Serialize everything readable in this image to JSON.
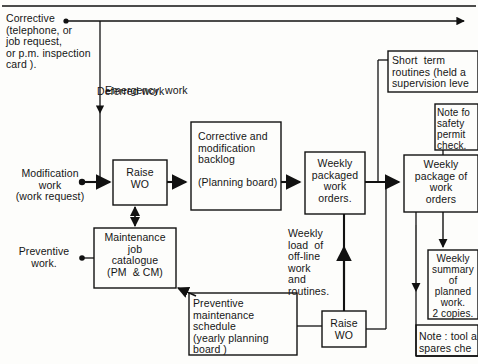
{
  "diagram": {
    "type": "flowchart",
    "stroke_color": "#111111",
    "background_color": "#fdfdfb"
  },
  "inputs": [
    {
      "id": "corrective",
      "label": "Corrective\n(telephone, or\njob request,\nor p.m. inspection\ncard )."
    },
    {
      "id": "modification",
      "label": "Modification\nwork\n(work request)"
    },
    {
      "id": "preventive",
      "label": "Preventive\nwork."
    }
  ],
  "flow_labels": [
    {
      "id": "emergency-work",
      "text": "Emergency  work"
    },
    {
      "id": "deferred-work",
      "text": "Deferred work"
    },
    {
      "id": "weekly-load",
      "text": "Weekly\nload  of\noff-line\nwork\nand\nroutines."
    }
  ],
  "boxes": [
    {
      "id": "raise-wo-top",
      "text": "Raise\nWO"
    },
    {
      "id": "corrective-backlog",
      "text": "Corrective and\nmodification\nbacklog\n\n(Planning board)"
    },
    {
      "id": "weekly-packaged",
      "text": "Weekly\npackaged\nwork\norders."
    },
    {
      "id": "maintenance-job-catalogue",
      "text": "Maintenance\njob\ncatalogue\n(PM  & CM)"
    },
    {
      "id": "preventive-schedule",
      "text": "Preventive\nmaintenance\nschedule\n(yearly planning\nboard )"
    },
    {
      "id": "raise-wo-bottom",
      "text": "Raise\nWO"
    },
    {
      "id": "short-term-routines",
      "text": "Short  term\nroutines (held a\nsupervision leve"
    },
    {
      "id": "note-safety-permit",
      "text": "Note fo\nsafety\npermit\ncheck."
    },
    {
      "id": "weekly-package-of-work-orders",
      "text": "Weekly\npackage of\nwork\norders"
    },
    {
      "id": "weekly-summary",
      "text": "Weekly\nsummary\nof\nplanned\nwork.\n2 copies."
    },
    {
      "id": "note-tool-spares",
      "text": "Note : tool a\nspares che"
    }
  ]
}
